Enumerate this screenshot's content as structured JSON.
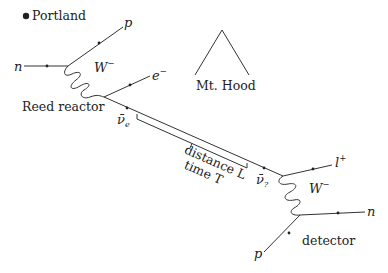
{
  "labels": {
    "city": "Portland",
    "mountain": "Mt. Hood",
    "source": "Reed reactor",
    "detector": "detector",
    "distance": "distance L",
    "time": "time T"
  },
  "source_vertex": {
    "incoming": "n",
    "outgoing_top": "p",
    "boson": "W",
    "boson_charge": "−",
    "lepton": "e",
    "lepton_charge": "−",
    "neutrino": "ν̄",
    "neutrino_flavor": "e"
  },
  "detector_vertex": {
    "neutrino": "ν̄",
    "neutrino_flavor": "?",
    "lepton": "l",
    "lepton_charge": "+",
    "boson": "W",
    "boson_charge": "−",
    "incoming": "p",
    "outgoing": "n"
  },
  "colors": {
    "line": "#333333",
    "text": "#222222",
    "background": "#ffffff"
  }
}
